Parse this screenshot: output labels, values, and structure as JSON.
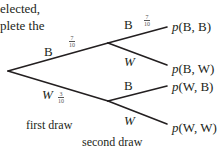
{
  "intro_text": {
    "line1": "elected,",
    "line2": "plete the"
  },
  "tree": {
    "first_draw": [
      {
        "label": "B",
        "prob_num": "7",
        "prob_den": "10"
      },
      {
        "label": "W",
        "prob_num": "3",
        "prob_den": "10"
      }
    ],
    "second_draw": [
      {
        "label": "B",
        "prob_num": "7",
        "prob_den": "10",
        "outcome": "p(B, B)"
      },
      {
        "label": "W",
        "outcome": "p(B, W)"
      },
      {
        "label": "B",
        "outcome": "p(W, B)"
      },
      {
        "label": "W",
        "outcome": "p(W, W)"
      }
    ],
    "line_color": "#231f20"
  },
  "captions": {
    "first": "first draw",
    "second": "second draw"
  },
  "outcomes": {
    "bb_p": "p",
    "bb_rest": "(B, B)",
    "bw_p": "p",
    "bw_rest": "(B, W)",
    "wb_p": "p",
    "wb_rest": "(W, B)",
    "ww_p": "p",
    "ww_rest": "(W, W)"
  }
}
